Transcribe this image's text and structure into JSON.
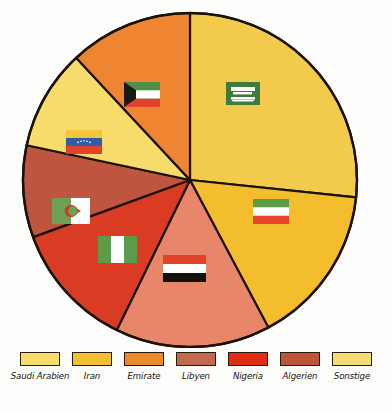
{
  "chart_data": {
    "type": "pie",
    "title": "",
    "subtitle": "",
    "xlabel": "",
    "ylabel": "",
    "legend_position": "bottom",
    "grid": false,
    "categories": [
      "Saudi Arabien",
      "Iran",
      "Emirate",
      "Libyen",
      "Nigeria",
      "Algerien",
      "Sonstige"
    ],
    "values": [
      26.7,
      15.6,
      15.0,
      11.9,
      12.2,
      8.9,
      9.7
    ],
    "unit": "%",
    "start_angle_deg": 0,
    "direction": "clockwise",
    "slices": [
      {
        "label": "Saudi Arabien",
        "value": 26.7,
        "color": "#f2cb4c",
        "start_deg": 0,
        "end_deg": 96,
        "flag": "saudi-arabia-flag"
      },
      {
        "label": "Iran",
        "value": 15.6,
        "color": "#f3bd2e",
        "start_deg": 96,
        "end_deg": 152,
        "flag": "iran-flag"
      },
      {
        "label": "Emirate",
        "value": 15.0,
        "color": "#e8866a",
        "start_deg": 152,
        "end_deg": 206,
        "flag": "yemen-flag"
      },
      {
        "label": "Nigeria",
        "value": 12.2,
        "color": "#d93c23",
        "start_deg": 206,
        "end_deg": 250,
        "flag": "nigeria-flag"
      },
      {
        "label": "Algerien",
        "value": 8.9,
        "color": "#c0553f",
        "start_deg": 250,
        "end_deg": 282,
        "flag": "algeria-flag"
      },
      {
        "label": "Sonstige",
        "value": 9.7,
        "color": "#f7dc6b",
        "start_deg": 282,
        "end_deg": 317,
        "flag": "venezuela-flag"
      },
      {
        "label": "Libyen",
        "value": 11.9,
        "color": "#ef8530",
        "start_deg": 317,
        "end_deg": 360,
        "flag": "kuwait-flag"
      }
    ]
  },
  "legend": {
    "items": [
      {
        "label": "Saudi Arabien",
        "color": "#f6dc6d"
      },
      {
        "label": "Iran",
        "color": "#f3c032"
      },
      {
        "label": "Emirate",
        "color": "#ea8a2c"
      },
      {
        "label": "Libyen",
        "color": "#c06a4e"
      },
      {
        "label": "Nigeria",
        "color": "#de2f14"
      },
      {
        "label": "Algerien",
        "color": "#bd543c"
      },
      {
        "label": "Sonstige",
        "color": "#f3dc73"
      }
    ]
  },
  "flags": {
    "saudi_arabia": {
      "name": "saudi-arabia-flag",
      "field": "#3e7a3a",
      "emblem": "#ffffff"
    },
    "iran": {
      "name": "iran-flag",
      "green": "#5d9a4a",
      "white": "#ffffff",
      "red": "#e8452a"
    },
    "kuwait": {
      "name": "kuwait-flag",
      "green": "#4e8f49",
      "white": "#ffffff",
      "red": "#e0432a",
      "black": "#1a1a14"
    },
    "venezuela": {
      "name": "venezuela-flag",
      "yellow": "#f2c63c",
      "blue": "#2f5ea8",
      "red": "#e0432a"
    },
    "algeria": {
      "name": "algeria-flag",
      "green": "#6f9e54",
      "white": "#ffffff",
      "red": "#d43a26"
    },
    "nigeria": {
      "name": "nigeria-flag",
      "green": "#5d9a4a",
      "white": "#ffffff"
    },
    "yemen": {
      "name": "yemen-flag",
      "red": "#e0432a",
      "white": "#ffffff",
      "black": "#14120e"
    }
  }
}
